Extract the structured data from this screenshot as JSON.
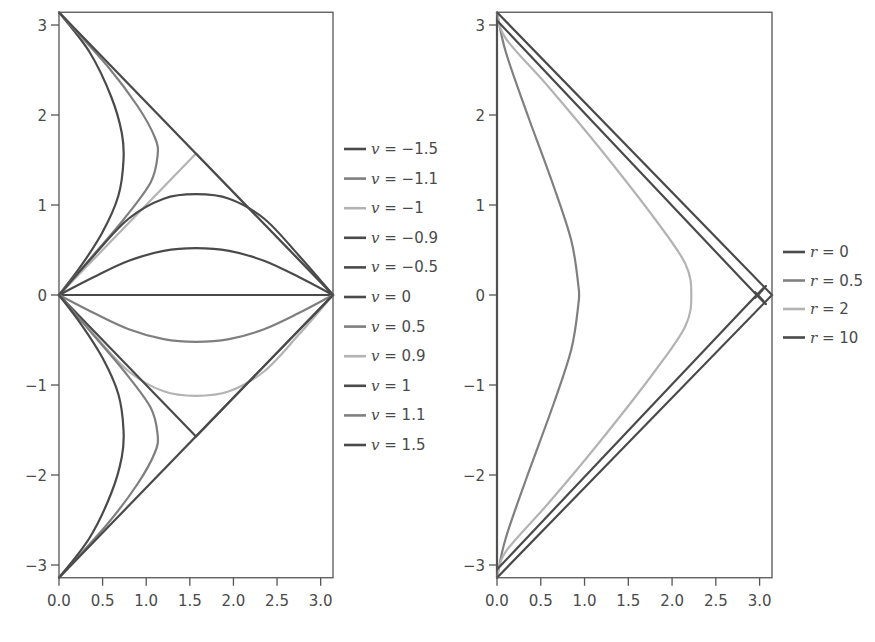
{
  "colors": {
    "dark": "#4a4a4a",
    "medium": "#7f7f7f",
    "light": "#b3b3b3",
    "axis": "#555555"
  },
  "chart_data": [
    {
      "type": "line",
      "title": "",
      "xlabel": "",
      "ylabel": "",
      "xlim": [
        0,
        3.14159
      ],
      "ylim": [
        -3.14159,
        3.14159
      ],
      "xticks": [
        "0.0",
        "0.5",
        "1.0",
        "1.5",
        "2.0",
        "2.5",
        "3.0"
      ],
      "yticks": [
        "3",
        "2",
        "1",
        "0",
        "−1",
        "−2",
        "−3"
      ],
      "grid": false,
      "legend_position": "right",
      "series": [
        {
          "name": "v = −1.5",
          "shade": "dark",
          "points": [
            [
              0,
              3.1416
            ],
            [
              0.35,
              2.7
            ],
            [
              0.6,
              2.2
            ],
            [
              0.72,
              1.8
            ],
            [
              0.74,
              1.5
            ],
            [
              0.68,
              1.1
            ],
            [
              0.5,
              0.7
            ],
            [
              0.25,
              0.32
            ],
            [
              0,
              0
            ]
          ]
        },
        {
          "name": "v = −1.1",
          "shade": "medium",
          "points": [
            [
              0,
              3.1416
            ],
            [
              0.55,
              2.55
            ],
            [
              0.9,
              2.1
            ],
            [
              1.1,
              1.75
            ],
            [
              1.13,
              1.55
            ],
            [
              1.05,
              1.25
            ],
            [
              0.75,
              0.85
            ],
            [
              0.4,
              0.45
            ],
            [
              0,
              0
            ]
          ]
        },
        {
          "name": "v = −1",
          "shade": "light",
          "points": [
            [
              0,
              0
            ],
            [
              1.5708,
              1.5708
            ],
            [
              3.1416,
              0
            ]
          ]
        },
        {
          "name": "v = −0.9",
          "shade": "dark",
          "points": [
            [
              0,
              0
            ],
            [
              0.4,
              0.44
            ],
            [
              0.8,
              0.85
            ],
            [
              1.2,
              1.07
            ],
            [
              1.57,
              1.12
            ],
            [
              1.95,
              1.07
            ],
            [
              2.35,
              0.85
            ],
            [
              2.75,
              0.44
            ],
            [
              3.1416,
              0
            ]
          ]
        },
        {
          "name": "v = −0.5",
          "shade": "dark",
          "points": [
            [
              0,
              0
            ],
            [
              0.4,
              0.2
            ],
            [
              0.8,
              0.38
            ],
            [
              1.2,
              0.49
            ],
            [
              1.57,
              0.52
            ],
            [
              1.95,
              0.49
            ],
            [
              2.35,
              0.38
            ],
            [
              2.75,
              0.2
            ],
            [
              3.1416,
              0
            ]
          ]
        },
        {
          "name": "v = 0",
          "shade": "dark",
          "points": [
            [
              0,
              0
            ],
            [
              3.1416,
              0
            ]
          ]
        },
        {
          "name": "v = 0.5",
          "shade": "medium",
          "points": [
            [
              0,
              0
            ],
            [
              0.4,
              -0.2
            ],
            [
              0.8,
              -0.38
            ],
            [
              1.2,
              -0.49
            ],
            [
              1.57,
              -0.52
            ],
            [
              1.95,
              -0.49
            ],
            [
              2.35,
              -0.38
            ],
            [
              2.75,
              -0.2
            ],
            [
              3.1416,
              0
            ]
          ]
        },
        {
          "name": "v = 0.9",
          "shade": "light",
          "points": [
            [
              0,
              0
            ],
            [
              0.4,
              -0.44
            ],
            [
              0.8,
              -0.85
            ],
            [
              1.2,
              -1.07
            ],
            [
              1.57,
              -1.12
            ],
            [
              1.95,
              -1.07
            ],
            [
              2.35,
              -0.85
            ],
            [
              2.75,
              -0.44
            ],
            [
              3.1416,
              0
            ]
          ]
        },
        {
          "name": "v = 1",
          "shade": "dark",
          "points": [
            [
              0,
              0
            ],
            [
              1.5708,
              -1.5708
            ],
            [
              3.1416,
              0
            ]
          ]
        },
        {
          "name": "v = 1.1",
          "shade": "medium",
          "points": [
            [
              0,
              -3.1416
            ],
            [
              0.55,
              -2.55
            ],
            [
              0.9,
              -2.1
            ],
            [
              1.1,
              -1.75
            ],
            [
              1.13,
              -1.55
            ],
            [
              1.05,
              -1.25
            ],
            [
              0.75,
              -0.85
            ],
            [
              0.4,
              -0.45
            ],
            [
              0,
              0
            ]
          ]
        },
        {
          "name": "v = 1.5",
          "shade": "dark",
          "points": [
            [
              0,
              -3.1416
            ],
            [
              0.35,
              -2.7
            ],
            [
              0.6,
              -2.2
            ],
            [
              0.72,
              -1.8
            ],
            [
              0.74,
              -1.5
            ],
            [
              0.68,
              -1.1
            ],
            [
              0.5,
              -0.7
            ],
            [
              0.25,
              -0.32
            ],
            [
              0,
              0
            ]
          ]
        }
      ],
      "boundary": [
        [
          0,
          3.1416
        ],
        [
          3.1416,
          0
        ],
        [
          0,
          -3.1416
        ]
      ]
    },
    {
      "type": "line",
      "title": "",
      "xlabel": "",
      "ylabel": "",
      "xlim": [
        0,
        3.14159
      ],
      "ylim": [
        -3.14159,
        3.14159
      ],
      "xticks": [
        "0.0",
        "0.5",
        "1.0",
        "1.5",
        "2.0",
        "2.5",
        "3.0"
      ],
      "yticks": [
        "3",
        "2",
        "1",
        "0",
        "−1",
        "−2",
        "−3"
      ],
      "grid": false,
      "legend_position": "right",
      "series": [
        {
          "name": "r = 0",
          "shade": "dark",
          "points": [
            [
              0,
              3.1416
            ],
            [
              0,
              -3.1416
            ]
          ]
        },
        {
          "name": "r = 0.5",
          "shade": "medium",
          "points": [
            [
              0,
              3.1416
            ],
            [
              0.1,
              2.7
            ],
            [
              0.35,
              2.0
            ],
            [
              0.65,
              1.2
            ],
            [
              0.85,
              0.6
            ],
            [
              0.93,
              0.1
            ],
            [
              0.93,
              -0.1
            ],
            [
              0.85,
              -0.6
            ],
            [
              0.65,
              -1.2
            ],
            [
              0.35,
              -2.0
            ],
            [
              0.1,
              -2.7
            ],
            [
              0,
              -3.1416
            ]
          ]
        },
        {
          "name": "r = 2",
          "shade": "light",
          "points": [
            [
              0,
              3.1416
            ],
            [
              0.1,
              2.85
            ],
            [
              0.6,
              2.3
            ],
            [
              1.2,
              1.6
            ],
            [
              1.8,
              0.85
            ],
            [
              2.15,
              0.35
            ],
            [
              2.22,
              0
            ],
            [
              2.15,
              -0.35
            ],
            [
              1.8,
              -0.85
            ],
            [
              1.2,
              -1.6
            ],
            [
              0.6,
              -2.3
            ],
            [
              0.1,
              -2.85
            ],
            [
              0,
              -3.1416
            ]
          ]
        },
        {
          "name": "r = 10",
          "shade": "dark",
          "points": [
            [
              0,
              3.05
            ],
            [
              2.82,
              0.15
            ],
            [
              2.95,
              0.03
            ],
            [
              2.95,
              -0.03
            ],
            [
              2.82,
              -0.15
            ],
            [
              0,
              -3.05
            ]
          ]
        }
      ],
      "boundary": [
        [
          0,
          3.1416
        ],
        [
          3.1416,
          0
        ],
        [
          0,
          -3.1416
        ]
      ]
    }
  ],
  "legends": {
    "left": [
      "v = −1.5",
      "v = −1.1",
      "v = −1",
      "v = −0.9",
      "v = −0.5",
      "v = 0",
      "v = 0.5",
      "v = 0.9",
      "v = 1",
      "v = 1.1",
      "v = 1.5"
    ],
    "right": [
      "r = 0",
      "r = 0.5",
      "r = 2",
      "r = 10"
    ]
  }
}
